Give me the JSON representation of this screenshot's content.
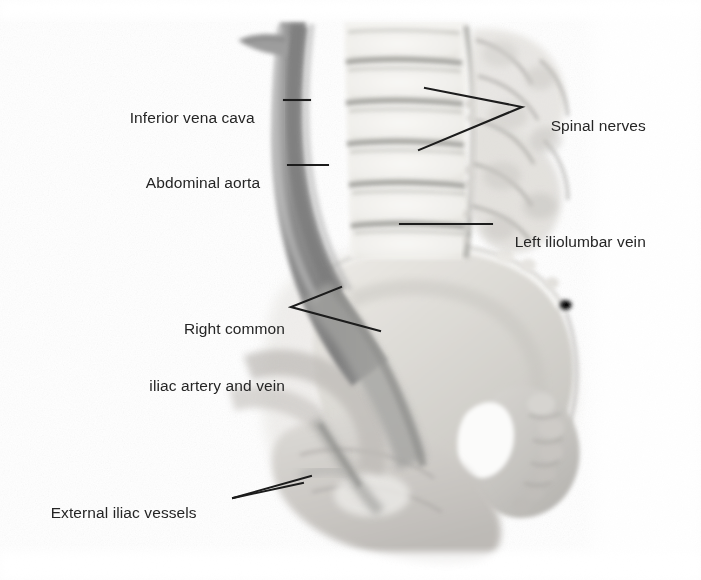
{
  "figure": {
    "background_color": "#ffffff",
    "label_text_color": "#252525",
    "leader_line_color": "#1c1c1c",
    "width": 701,
    "height": 580
  },
  "labels": [
    {
      "id": "inferior-vena-cava",
      "text": "Inferior vena cava",
      "x": 112,
      "y": 89,
      "align": "left",
      "leader": "single-horizontal"
    },
    {
      "id": "abdominal-aorta",
      "text": "Abdominal aorta",
      "x": 129,
      "y": 154,
      "align": "left",
      "leader": "single-horizontal"
    },
    {
      "id": "spinal-nerves",
      "text": "Spinal nerves",
      "x": 533,
      "y": 97,
      "align": "left",
      "leader": "double-prong-left"
    },
    {
      "id": "left-iliolumbar-vein",
      "text": "Left iliolumbar vein",
      "x": 497,
      "y": 213,
      "align": "left",
      "leader": "single-horizontal"
    },
    {
      "id": "right-common-iliac-artery-and-vein",
      "text_line_1": "Right common",
      "text_line_2": "iliac artery and vein",
      "x": 105,
      "y": 281,
      "align": "right",
      "leader": "double-prong-right"
    },
    {
      "id": "external-iliac-vessels",
      "text": "External iliac vessels",
      "x": 33,
      "y": 484,
      "align": "left",
      "leader": "narrow-double-prong-right"
    }
  ],
  "anatomy": {
    "structures": [
      {
        "name": "abdominal-aorta-and-vena-cava-band",
        "tone": "#8b8b8b"
      },
      {
        "name": "vessel-branch-superior-left",
        "tone": "#9a9a9a"
      },
      {
        "name": "lumbar-vertebral-bodies",
        "tone": "#f1f0ed"
      },
      {
        "name": "intervertebral-disc-spaces",
        "tone": "#97978f"
      },
      {
        "name": "spinal-nerve-roots",
        "tone": "#b2b2ac"
      },
      {
        "name": "iliac-wing",
        "tone": "#dedcd8"
      },
      {
        "name": "common-iliac-vessels",
        "tone": "#9c9c9a"
      },
      {
        "name": "sacrum-and-coccyx",
        "tone": "#c9c7c3"
      },
      {
        "name": "ischium-and-pubis",
        "tone": "#d3d1cd"
      },
      {
        "name": "external-iliac-vessels-structure",
        "tone": "#a4a4a0"
      }
    ]
  }
}
